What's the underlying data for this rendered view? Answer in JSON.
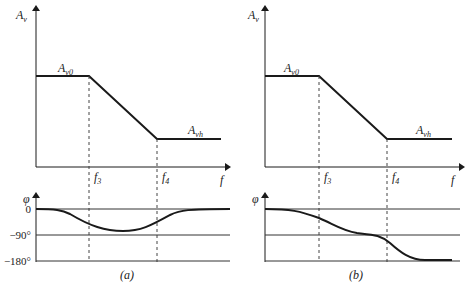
{
  "figure": {
    "panels": [
      {
        "id": "a",
        "caption": "(a)",
        "amplitude": {
          "y_label_main": "A",
          "y_label_sub": "v",
          "x_label": "f",
          "plateau_label_main": "A",
          "plateau_label_sub": "v0",
          "high_label_main": "A",
          "high_label_sub": "vh"
        },
        "freq_marks": [
          {
            "main": "f",
            "sub": "3"
          },
          {
            "main": "f",
            "sub": "4"
          }
        ],
        "phase": {
          "y_label": "φ",
          "ticks": [
            "0",
            "−90°",
            "−180°"
          ],
          "shape": "dip: starts at 0, dips toward about −75° between f3 and f4, returns to 0"
        }
      },
      {
        "id": "b",
        "caption": "(b)",
        "amplitude": {
          "y_label_main": "A",
          "y_label_sub": "v",
          "x_label": "f",
          "plateau_label_main": "A",
          "plateau_label_sub": "v0",
          "high_label_main": "A",
          "high_label_sub": "vh"
        },
        "freq_marks": [
          {
            "main": "f",
            "sub": "3"
          },
          {
            "main": "f",
            "sub": "4"
          }
        ],
        "phase": {
          "y_label": "φ",
          "ticks": [],
          "shape": "monotonic: 0 → about −90° near midpoint → −180° at high f"
        }
      }
    ],
    "colors": {
      "line": "#1a1a1a",
      "grid": "#333333",
      "dash": "#444444"
    }
  }
}
